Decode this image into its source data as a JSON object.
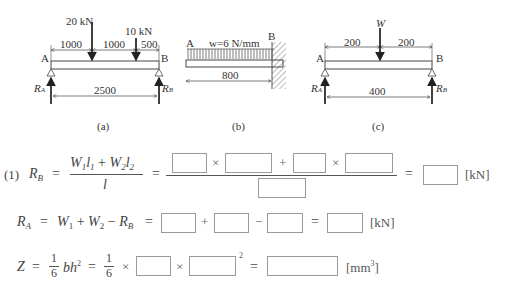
{
  "figures": {
    "a": {
      "caption": "(a)",
      "load1": "20 kN",
      "load2": "10 kN",
      "dim1": "1000",
      "dim2": "1000",
      "dim3": "500",
      "span": "2500",
      "left_label": "A",
      "right_label": "B",
      "reaction_left": "R",
      "reaction_left_sub": "A",
      "reaction_right": "R",
      "reaction_right_sub": "B"
    },
    "b": {
      "caption": "(b)",
      "load": "w=6 N/mm",
      "length": "800",
      "left_label": "A",
      "right_label": "B"
    },
    "c": {
      "caption": "(c)",
      "load": "W",
      "dim1": "200",
      "dim2": "200",
      "span": "400",
      "left_label": "A",
      "right_label": "B",
      "reaction_left": "R",
      "reaction_left_sub": "A",
      "reaction_right": "R",
      "reaction_right_sub": "B"
    }
  },
  "equations": {
    "eq1": {
      "number": "(1)",
      "lhs": "R",
      "lhs_sub": "B",
      "eq": "=",
      "num_W1": "W",
      "num_l1": "l",
      "plus": "+",
      "num_W2": "W",
      "num_l2": "l",
      "den": "l",
      "times": "×",
      "unit": "[kN]"
    },
    "eq2": {
      "lhs": "R",
      "lhs_sub": "A",
      "eq": "=",
      "W": "W",
      "plus": "+",
      "minus": "−",
      "rb": "R",
      "rb_sub": "B",
      "unit": "[kN]"
    },
    "eq3": {
      "lhs": "Z",
      "eq": "=",
      "one": "1",
      "six": "6",
      "bh": "bh",
      "sq": "2",
      "times": "×",
      "unit_pre": "[mm",
      "unit_sup": "3",
      "unit_post": "]"
    }
  },
  "answer_boxes": {
    "eq1": [
      "",
      "",
      "",
      "",
      "",
      ""
    ],
    "eq2": [
      "",
      "",
      "",
      ""
    ],
    "eq3": [
      "",
      "",
      ""
    ]
  }
}
